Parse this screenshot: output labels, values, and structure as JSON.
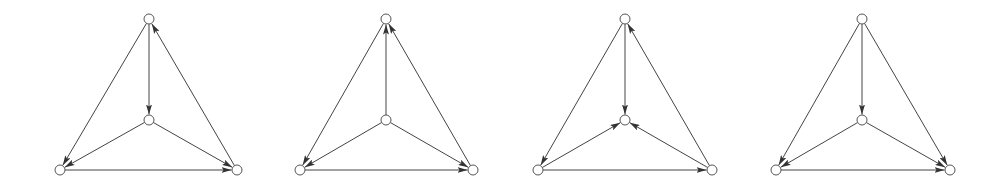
{
  "figure": {
    "style": {
      "edge_color": "#444444",
      "node_fill": "#ffffff",
      "node_stroke": "#555555",
      "node_radius": 5
    },
    "graphs": [
      {
        "id": "graph-1",
        "nodes": {
          "T": [
            149,
            19
          ],
          "C": [
            149,
            120
          ],
          "BL": [
            60,
            170
          ],
          "BR": [
            237,
            170
          ]
        },
        "edges": [
          [
            "T",
            "C"
          ],
          [
            "T",
            "BL"
          ],
          [
            "BR",
            "T"
          ],
          [
            "C",
            "BL"
          ],
          [
            "C",
            "BR"
          ],
          [
            "BL",
            "BR"
          ]
        ]
      },
      {
        "id": "graph-2",
        "nodes": {
          "T": [
            386,
            19
          ],
          "C": [
            386,
            120
          ],
          "BL": [
            300,
            170
          ],
          "BR": [
            473,
            170
          ]
        },
        "edges": [
          [
            "C",
            "T"
          ],
          [
            "T",
            "BL"
          ],
          [
            "BR",
            "T"
          ],
          [
            "C",
            "BL"
          ],
          [
            "C",
            "BR"
          ],
          [
            "BL",
            "BR"
          ]
        ]
      },
      {
        "id": "graph-3",
        "nodes": {
          "T": [
            625,
            19
          ],
          "C": [
            625,
            120
          ],
          "BL": [
            538,
            170
          ],
          "BR": [
            712,
            170
          ]
        },
        "edges": [
          [
            "T",
            "C"
          ],
          [
            "T",
            "BL"
          ],
          [
            "BR",
            "T"
          ],
          [
            "BL",
            "C"
          ],
          [
            "BR",
            "C"
          ],
          [
            "BL",
            "BR"
          ]
        ]
      },
      {
        "id": "graph-4",
        "nodes": {
          "T": [
            862,
            19
          ],
          "C": [
            862,
            120
          ],
          "BL": [
            776,
            170
          ],
          "BR": [
            950,
            170
          ]
        },
        "edges": [
          [
            "T",
            "C"
          ],
          [
            "T",
            "BL"
          ],
          [
            "T",
            "BR"
          ],
          [
            "C",
            "BL"
          ],
          [
            "C",
            "BR"
          ],
          [
            "BL",
            "BR"
          ]
        ]
      }
    ]
  }
}
